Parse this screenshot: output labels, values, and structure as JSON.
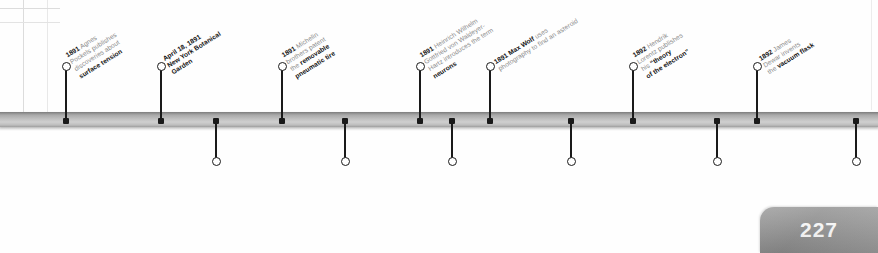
{
  "page": {
    "number": "227",
    "timeline_color": "#b5b5b5",
    "marker_color": "#1a1a1a",
    "text_color": "#8a8a8a",
    "emphasis_color": "#111111"
  },
  "events_above": [
    {
      "id": "agnes-pockels",
      "x": 66,
      "lines": [
        {
          "date": "1891",
          "rest": " Agnes"
        },
        {
          "plain": "Pockels publishes"
        },
        {
          "plain": "discoveries about"
        },
        {
          "bold": "surface tension"
        }
      ]
    },
    {
      "id": "ny-botanical-garden",
      "x": 161,
      "lines": [
        {
          "date": "April 18, 1891"
        },
        {
          "bold": "New York Botanical"
        },
        {
          "bold": "Garden",
          "rest": " is founded"
        }
      ]
    },
    {
      "id": "michelin-pneumatic-tire",
      "x": 282,
      "lines": [
        {
          "date": "1891",
          "rest": " Michelin"
        },
        {
          "plain": "brothers patent"
        },
        {
          "plain": "the ",
          "bold": "removable"
        },
        {
          "bold": "pneumatic tire"
        }
      ]
    },
    {
      "id": "waldeyer-hartz-neurons",
      "x": 420,
      "lines": [
        {
          "date": "1891",
          "rest": " Heinrich Wilhelm"
        },
        {
          "plain": "Gottfried von Waldeyer-"
        },
        {
          "plain": "Hartz introduces the term"
        },
        {
          "bold": "neurons",
          "rest": " for nerve cells"
        }
      ]
    },
    {
      "id": "max-wolf-asteroid",
      "x": 490,
      "lines": [
        {
          "date": "1891 Max Wolf",
          "rest": " uses"
        },
        {
          "plain": "photography to find an asteroid"
        }
      ]
    },
    {
      "id": "lorentz-electron-theory",
      "x": 633,
      "lines": [
        {
          "date": "1892",
          "rest": " Hendrik"
        },
        {
          "plain": "Lorentz publishes"
        },
        {
          "plain": "his ",
          "bold": "“theory"
        },
        {
          "bold": "of the electron”"
        }
      ]
    },
    {
      "id": "dewar-vacuum-flask",
      "x": 757,
      "lines": [
        {
          "date": "1892",
          "rest": " James"
        },
        {
          "plain": "Dewar invents"
        },
        {
          "plain": "the ",
          "bold": "vacuum flask"
        }
      ]
    }
  ],
  "events_below": [
    {
      "id": "moving-picture-system",
      "x": 216,
      "lines": [
        {
          "date": "May 20, 1891",
          "rest": " First public"
        },
        {
          "plain": "demonstration of a ",
          "bold": "moving"
        },
        {
          "bold": "picture system"
        }
      ]
    },
    {
      "id": "systeme-panhard",
      "x": 345,
      "lines": [
        {
          "date": "1891",
          "rest": " A car layout known"
        },
        {
          "plain": "as ",
          "bold": "Système Panhard",
          "rest2": " is used"
        },
        {
          "plain": "by Panhard et Levassor"
        }
      ]
    },
    {
      "id": "pithecanthropus-erectus",
      "x": 452,
      "lines": [
        {
          "date": "1891",
          "rest": " Eugene Dubois discovers"
        },
        {
          "plain": "remains of what he calls"
        },
        {
          "bolditalic": "Pithecanthropus erectus"
        },
        {
          "italic": "(now, Homo erectus)"
        }
      ]
    },
    {
      "id": "poincare-celestial-mechanics",
      "x": 571,
      "lines": [
        {
          "date": "1892 Henri Poincaré"
        },
        {
          "plain": "publishes the first volume"
        },
        {
          "plain": "of New Methods of"
        },
        {
          "plain": "Celestial Mechanics"
        }
      ]
    },
    {
      "id": "rudolf-diesel-patent",
      "x": 717,
      "lines": [
        {
          "date": "1892",
          "rest": " Rudolf Diesel receives a"
        },
        {
          "plain": "patent for “method of and for"
        },
        {
          "bold": "converting heat into work”"
        },
        {
          "plain": "paving the way for the"
        },
        {
          "plain": "diesel engine"
        }
      ]
    },
    {
      "id": "hennebique-reinforced-concrete",
      "x": 856,
      "lines": [
        {
          "date": "1892",
          "rest": " François Hennebique"
        },
        {
          "plain": "patents ",
          "bold": "reinforced concrete"
        }
      ]
    }
  ]
}
